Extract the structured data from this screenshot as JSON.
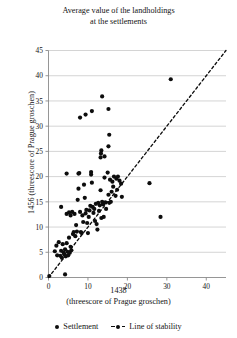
{
  "chart_data": {
    "type": "scatter",
    "title": "Average value of the landholdings at the settlements",
    "title_lines": [
      "Average value of the landholdings",
      "at the settlements"
    ],
    "xlabel_lines": [
      "1438",
      "(threescore of Prague groschen)"
    ],
    "xlabel": "1438 (threescore of Prague groschen)",
    "ylabel": "1456 (threescore of Prague groschen)",
    "xlim": [
      0,
      45
    ],
    "ylim": [
      0,
      45
    ],
    "xticks": [
      0,
      10,
      20,
      30,
      40
    ],
    "yticks": [
      0,
      5,
      10,
      15,
      20,
      25,
      30,
      35,
      40,
      45
    ],
    "grid": "horizontal",
    "legend_position": "bottom",
    "series": [
      {
        "name": "Settlement",
        "marker": "circle",
        "color": "#0d0d0d",
        "points": [
          [
            0.2,
            0.3
          ],
          [
            4.2,
            0.6
          ],
          [
            1.6,
            5.2
          ],
          [
            2.0,
            6.3
          ],
          [
            2.2,
            4.4
          ],
          [
            2.6,
            7.0
          ],
          [
            3.0,
            4.3
          ],
          [
            3.2,
            5.3
          ],
          [
            3.4,
            3.9
          ],
          [
            3.6,
            6.6
          ],
          [
            3.8,
            5.0
          ],
          [
            4.0,
            4.6
          ],
          [
            4.2,
            5.6
          ],
          [
            4.4,
            4.2
          ],
          [
            4.6,
            6.8
          ],
          [
            4.8,
            5.1
          ],
          [
            5.0,
            4.4
          ],
          [
            5.2,
            7.9
          ],
          [
            5.4,
            4.9
          ],
          [
            5.6,
            6.1
          ],
          [
            5.8,
            5.4
          ],
          [
            3.2,
            14.0
          ],
          [
            4.6,
            12.6
          ],
          [
            5.2,
            12.9
          ],
          [
            5.6,
            12.3
          ],
          [
            6.0,
            13.0
          ],
          [
            6.2,
            8.6
          ],
          [
            6.4,
            9.0
          ],
          [
            6.6,
            12.6
          ],
          [
            6.8,
            8.2
          ],
          [
            7.0,
            10.4
          ],
          [
            7.2,
            9.1
          ],
          [
            7.4,
            15.4
          ],
          [
            7.6,
            17.6
          ],
          [
            7.8,
            20.7
          ],
          [
            8.0,
            13.0
          ],
          [
            8.2,
            9.0
          ],
          [
            8.4,
            8.8
          ],
          [
            8.6,
            12.3
          ],
          [
            8.8,
            11.0
          ],
          [
            9.0,
            18.4
          ],
          [
            9.2,
            15.8
          ],
          [
            9.4,
            12.7
          ],
          [
            9.6,
            13.4
          ],
          [
            9.8,
            10.8
          ],
          [
            10.0,
            8.8
          ],
          [
            10.2,
            12.0
          ],
          [
            10.4,
            13.3
          ],
          [
            10.6,
            14.2
          ],
          [
            10.8,
            20.9
          ],
          [
            11.0,
            18.8
          ],
          [
            11.2,
            14.0
          ],
          [
            11.4,
            12.8
          ],
          [
            11.6,
            13.6
          ],
          [
            11.8,
            11.2
          ],
          [
            12.0,
            14.6
          ],
          [
            12.2,
            10.6
          ],
          [
            12.4,
            9.5
          ],
          [
            12.6,
            14.8
          ],
          [
            12.8,
            13.2
          ],
          [
            13.0,
            14.3
          ],
          [
            13.2,
            17.3
          ],
          [
            13.4,
            11.8
          ],
          [
            13.6,
            15.0
          ],
          [
            13.8,
            14.5
          ],
          [
            14.0,
            12.0
          ],
          [
            14.2,
            19.8
          ],
          [
            14.4,
            14.9
          ],
          [
            14.6,
            13.6
          ],
          [
            15.0,
            20.8
          ],
          [
            15.2,
            16.4
          ],
          [
            15.4,
            14.8
          ],
          [
            15.6,
            19.4
          ],
          [
            15.8,
            15.0
          ],
          [
            16.0,
            17.0
          ],
          [
            16.2,
            19.0
          ],
          [
            16.4,
            18.0
          ],
          [
            16.6,
            20.0
          ],
          [
            17.0,
            16.2
          ],
          [
            17.2,
            19.6
          ],
          [
            17.4,
            17.4
          ],
          [
            17.6,
            20.0
          ],
          [
            18.0,
            19.2
          ],
          [
            18.4,
            18.6
          ],
          [
            18.6,
            16.0
          ],
          [
            8.0,
            31.7
          ],
          [
            9.4,
            32.3
          ],
          [
            11.0,
            33.0
          ],
          [
            13.6,
            35.9
          ],
          [
            15.2,
            33.4
          ],
          [
            15.4,
            28.3
          ],
          [
            15.2,
            26.0
          ],
          [
            13.4,
            25.2
          ],
          [
            13.3,
            24.6
          ],
          [
            13.2,
            23.8
          ],
          [
            14.2,
            24.0
          ],
          [
            4.6,
            20.6
          ],
          [
            7.6,
            20.6
          ],
          [
            10.8,
            20.4
          ],
          [
            25.6,
            18.7
          ],
          [
            28.4,
            12.0
          ],
          [
            31.0,
            39.3
          ]
        ]
      }
    ],
    "reference_line": {
      "name": "Line of stability",
      "style": "dashed",
      "color": "#0d0d0d",
      "from": [
        0,
        0
      ],
      "to": [
        45,
        45
      ]
    }
  },
  "legend": {
    "items": [
      {
        "label": "Settlement",
        "marker": "dot"
      },
      {
        "label": "Line of stability",
        "marker": "dashed-dot"
      }
    ]
  }
}
